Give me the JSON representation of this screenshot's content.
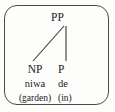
{
  "figure": {
    "type": "syntax-tree",
    "border_color": "#4a4a4a",
    "line_color": "#3a3a3a",
    "text_color": "#1a1a1a",
    "background_color": "#fdfdfc"
  },
  "tree": {
    "root": {
      "label": "PP"
    },
    "children": [
      {
        "category": "NP",
        "word": "niwa",
        "gloss": "(garden)"
      },
      {
        "category": "P",
        "word": "de",
        "gloss": "(in)"
      }
    ]
  },
  "edges": [
    {
      "name": "pp-to-np",
      "x1": 64,
      "y1": 26,
      "x2": 33,
      "y2": 61
    },
    {
      "name": "pp-to-p",
      "x1": 66,
      "y1": 26,
      "x2": 66,
      "y2": 61
    }
  ]
}
